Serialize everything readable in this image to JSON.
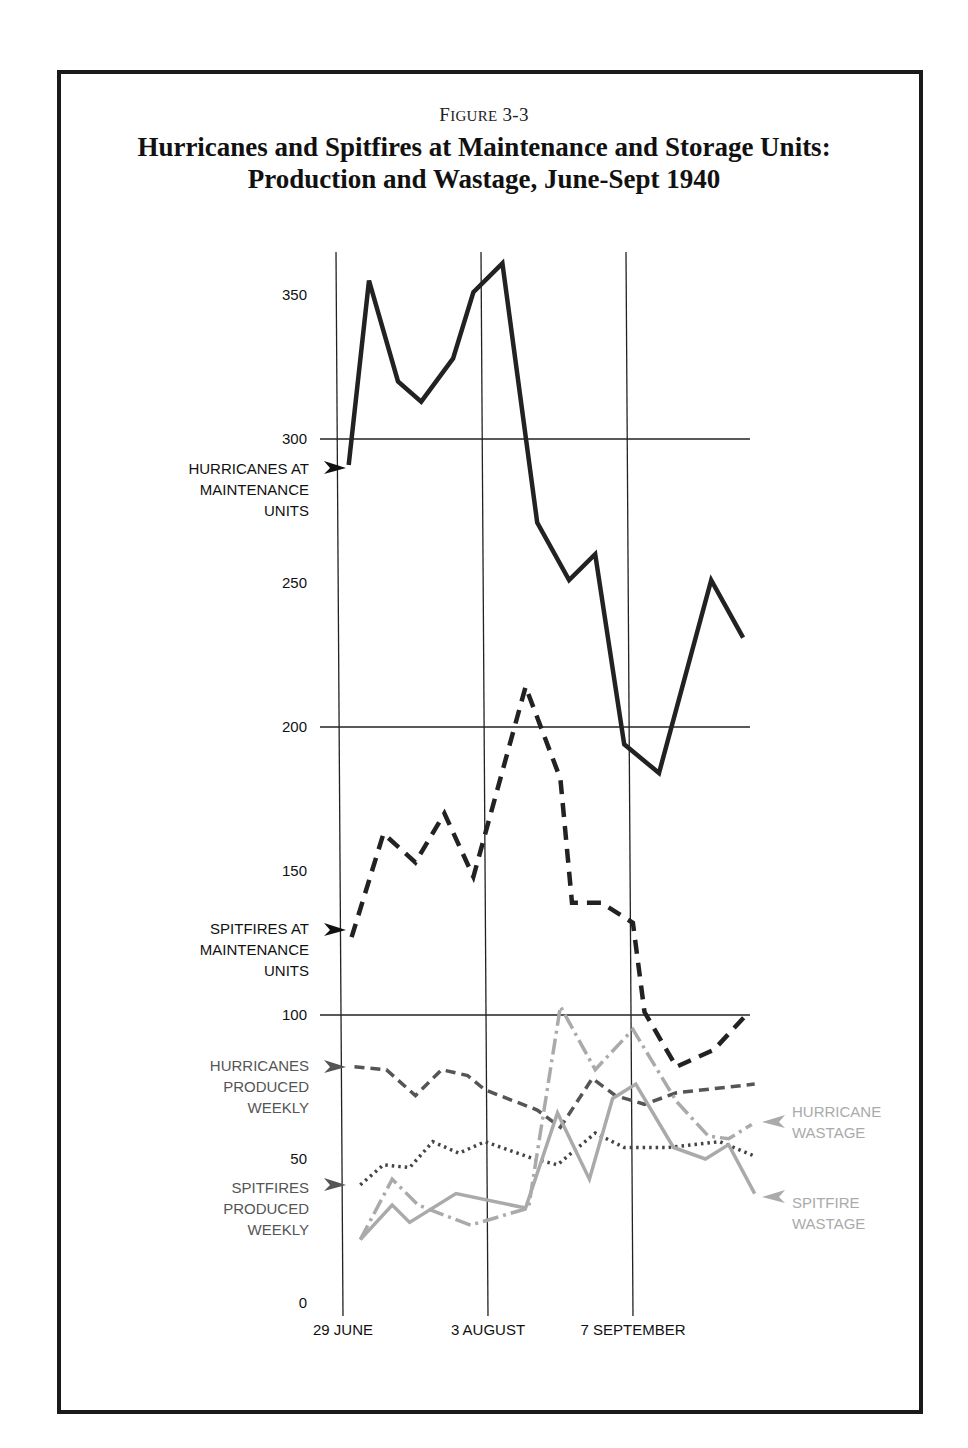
{
  "figure": {
    "label_prefix": "F",
    "label_smallcaps": "IGURE",
    "label_number": "3-3",
    "title_line1": "Hurricanes and Spitfires at Maintenance and Storage Units:",
    "title_line2": "Production and Wastage, June-Sept 1940"
  },
  "colors": {
    "frame": "#1a1a1a",
    "grid": "#222222",
    "hurricanes_mu": "#222222",
    "spitfires_mu": "#222222",
    "hurricanes_produced": "#555555",
    "spitfires_produced": "#444444",
    "hurricane_wastage": "#aaaaaa",
    "spitfire_wastage": "#aaaaaa"
  },
  "chart_data": {
    "type": "line",
    "title": "Hurricanes and Spitfires at Maintenance and Storage Units: Production and Wastage, June-Sept 1940",
    "xlabel": "",
    "ylabel": "",
    "ylim": [
      0,
      370
    ],
    "y_ticks": [
      0,
      50,
      100,
      150,
      200,
      250,
      300,
      350
    ],
    "x_tick_labels": [
      {
        "label": "29 JUNE",
        "week": 0
      },
      {
        "label": "3 AUGUST",
        "week": 5
      },
      {
        "label": "7 SEPTEMBER",
        "week": 10
      }
    ],
    "grid": {
      "horizontal_at": [
        100,
        200,
        300
      ],
      "vertical_at_weeks": [
        0,
        5,
        10
      ]
    },
    "legend_position": "inline labels with arrows (left and right of plot)",
    "series": [
      {
        "name": "HURRICANES AT MAINTENANCE UNITS",
        "style": "solid-thick",
        "points": [
          [
            0.3,
            291
          ],
          [
            1.0,
            355
          ],
          [
            2.0,
            320
          ],
          [
            2.8,
            313
          ],
          [
            3.9,
            328
          ],
          [
            4.6,
            351
          ],
          [
            5.6,
            361
          ],
          [
            6.8,
            271
          ],
          [
            7.9,
            251
          ],
          [
            8.8,
            260
          ],
          [
            9.8,
            194
          ],
          [
            11.0,
            184
          ],
          [
            12.8,
            251
          ],
          [
            13.9,
            231
          ]
        ]
      },
      {
        "name": "SPITFIRES AT MAINTENANCE UNITS",
        "style": "dashed-thick",
        "points": [
          [
            0.4,
            127
          ],
          [
            1.5,
            163
          ],
          [
            2.6,
            153
          ],
          [
            3.6,
            170
          ],
          [
            4.6,
            148
          ],
          [
            6.4,
            214
          ],
          [
            7.6,
            182
          ],
          [
            8.0,
            139
          ],
          [
            9.0,
            139
          ],
          [
            10.1,
            132
          ],
          [
            10.5,
            101
          ],
          [
            11.6,
            82
          ],
          [
            12.9,
            88
          ],
          [
            14.1,
            101
          ]
        ]
      },
      {
        "name": "HURRICANES PRODUCED WEEKLY",
        "style": "dashed",
        "points": [
          [
            0.5,
            82
          ],
          [
            1.6,
            81
          ],
          [
            2.6,
            72
          ],
          [
            3.5,
            81
          ],
          [
            4.4,
            79
          ],
          [
            5.0,
            74
          ],
          [
            6.8,
            67
          ],
          [
            7.6,
            61
          ],
          [
            8.7,
            78
          ],
          [
            9.5,
            72
          ],
          [
            10.5,
            69
          ],
          [
            11.6,
            73
          ],
          [
            14.3,
            76
          ]
        ]
      },
      {
        "name": "SPITFIRES PRODUCED WEEKLY",
        "style": "dotted",
        "points": [
          [
            0.7,
            41
          ],
          [
            1.5,
            48
          ],
          [
            2.4,
            47
          ],
          [
            3.2,
            56
          ],
          [
            4.1,
            52
          ],
          [
            5.0,
            56
          ],
          [
            6.7,
            50
          ],
          [
            7.5,
            48
          ],
          [
            8.8,
            59
          ],
          [
            9.8,
            54
          ],
          [
            11.3,
            54
          ],
          [
            13.1,
            56
          ],
          [
            14.3,
            51
          ]
        ]
      },
      {
        "name": "HURRICANE WASTAGE",
        "style": "dash-dot-light",
        "points": [
          [
            0.7,
            22
          ],
          [
            1.8,
            43
          ],
          [
            2.7,
            34
          ],
          [
            4.5,
            27
          ],
          [
            6.5,
            33
          ],
          [
            7.6,
            103
          ],
          [
            8.8,
            81
          ],
          [
            10.1,
            95
          ],
          [
            11.6,
            70
          ],
          [
            12.7,
            58
          ],
          [
            13.4,
            57
          ],
          [
            14.2,
            62
          ]
        ]
      },
      {
        "name": "SPITFIRE WASTAGE",
        "style": "solid-light",
        "points": [
          [
            0.7,
            22
          ],
          [
            1.8,
            34
          ],
          [
            2.4,
            28
          ],
          [
            4.0,
            38
          ],
          [
            6.4,
            33
          ],
          [
            7.5,
            66
          ],
          [
            8.6,
            43
          ],
          [
            9.4,
            71
          ],
          [
            10.2,
            76
          ],
          [
            11.5,
            54
          ],
          [
            12.6,
            50
          ],
          [
            13.4,
            55
          ],
          [
            14.3,
            38
          ]
        ]
      }
    ]
  },
  "labels": {
    "hurricanes_mu": [
      "HURRICANES AT",
      "MAINTENANCE",
      "UNITS"
    ],
    "spitfires_mu": [
      "SPITFIRES AT",
      "MAINTENANCE",
      "UNITS"
    ],
    "hurricanes_produced": [
      "HURRICANES",
      "PRODUCED",
      "WEEKLY"
    ],
    "spitfires_produced": [
      "SPITFIRES",
      "PRODUCED",
      "WEEKLY"
    ],
    "hurricane_wastage": [
      "HURRICANE",
      "WASTAGE"
    ],
    "spitfire_wastage": [
      "SPITFIRE",
      "WASTAGE"
    ]
  }
}
